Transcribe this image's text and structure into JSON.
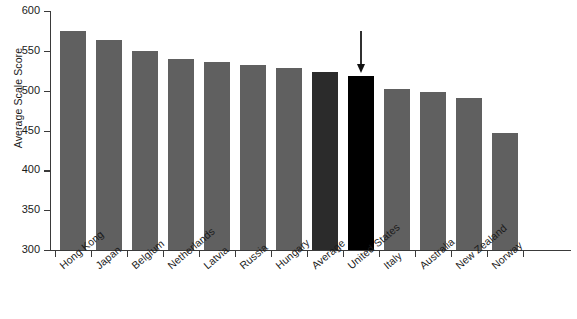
{
  "chart_data": {
    "type": "bar",
    "title": "",
    "subtitle": "",
    "xlabel": "",
    "ylabel": "Average Scale Score",
    "ylim": [
      300,
      600
    ],
    "yticks": [
      300,
      350,
      400,
      450,
      500,
      550,
      600
    ],
    "ytick_labels": [
      "300",
      "350",
      "400",
      "450",
      "500",
      "550",
      "600"
    ],
    "grid": false,
    "legend": null,
    "categories": [
      "Hong Kong",
      "Japan",
      "Belgium",
      "Netherlands",
      "Latvia",
      "Russia",
      "Hungary",
      "Average",
      "United States",
      "Italy",
      "Australia",
      "New Zealand",
      "Norway"
    ],
    "values": [
      575,
      564,
      550,
      540,
      536,
      532,
      529,
      523,
      518,
      502,
      498,
      491,
      447
    ],
    "bar_colors": [
      "#606060",
      "#606060",
      "#606060",
      "#606060",
      "#606060",
      "#606060",
      "#606060",
      "#2b2b2b",
      "#000000",
      "#606060",
      "#606060",
      "#606060",
      "#606060"
    ],
    "annotations": [
      {
        "type": "arrow",
        "target_category": "United States",
        "direction": "down",
        "label": ""
      }
    ]
  },
  "colors": {
    "bar_default": "#606060",
    "bar_average": "#2b2b2b",
    "bar_highlight": "#000000",
    "axis": "#3a3a3a",
    "text": "#1a1a1a",
    "background": "#ffffff"
  }
}
